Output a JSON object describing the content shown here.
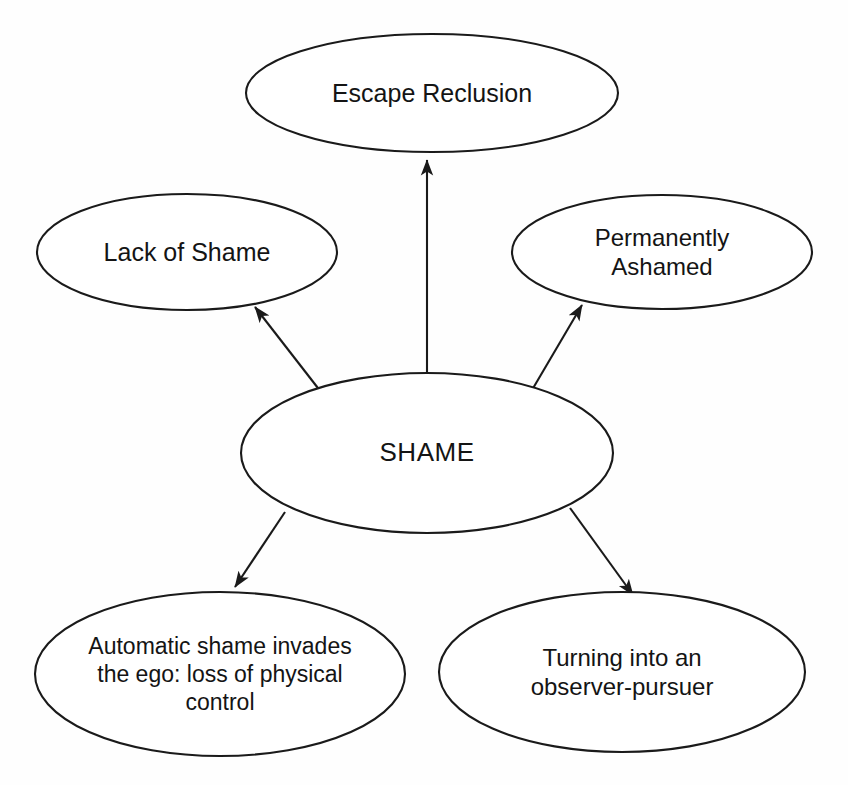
{
  "diagram": {
    "type": "concept-map",
    "background_color": "#fefefe",
    "stroke_color": "#1a1a1a",
    "text_color": "#141414",
    "center": {
      "id": "shame",
      "label": "SHAME",
      "cx": 427,
      "cy": 453,
      "rx": 186,
      "ry": 80,
      "font_size": 26
    },
    "nodes": [
      {
        "id": "escape-reclusion",
        "label": "Escape Reclusion",
        "cx": 432,
        "cy": 93,
        "rx": 186,
        "ry": 59,
        "font_size": 25
      },
      {
        "id": "lack-of-shame",
        "label": "Lack of Shame",
        "cx": 187,
        "cy": 252,
        "rx": 150,
        "ry": 58,
        "font_size": 25
      },
      {
        "id": "permanently-ashamed",
        "label": "Permanently\nAshamed",
        "cx": 662,
        "cy": 252,
        "rx": 150,
        "ry": 57,
        "font_size": 24
      },
      {
        "id": "automatic-shame-invades-the-ego",
        "label": "Automatic shame invades\nthe ego: loss of physical\ncontrol",
        "cx": 220,
        "cy": 674,
        "rx": 185,
        "ry": 82,
        "font_size": 23
      },
      {
        "id": "turning-into-an-observer-pursuer",
        "label": "Turning into an\nobserver-pursuer",
        "cx": 622,
        "cy": 672,
        "rx": 183,
        "ry": 80,
        "font_size": 24
      }
    ],
    "edges": [
      {
        "id": "shame-to-escape-reclusion",
        "from": "shame",
        "to": "escape-reclusion",
        "x1": 427,
        "y1": 373,
        "x2": 427,
        "y2": 160,
        "direction": "up"
      },
      {
        "id": "shame-to-lack-of-shame",
        "from": "shame",
        "to": "lack-of-shame",
        "x1": 321,
        "y1": 392,
        "x2": 255,
        "y2": 307,
        "direction": "up-left"
      },
      {
        "id": "shame-to-permanently-ashamed",
        "from": "shame",
        "to": "permanently-ashamed",
        "x1": 532,
        "y1": 390,
        "x2": 582,
        "y2": 305,
        "direction": "up-right"
      },
      {
        "id": "shame-to-automatic-shame",
        "from": "shame",
        "to": "automatic-shame-invades-the-ego",
        "x1": 285,
        "y1": 512,
        "x2": 235,
        "y2": 587,
        "direction": "down-left"
      },
      {
        "id": "shame-to-turning-into-observer",
        "from": "shame",
        "to": "turning-into-an-observer-pursuer",
        "x1": 570,
        "y1": 508,
        "x2": 633,
        "y2": 595,
        "direction": "down-right"
      }
    ]
  }
}
